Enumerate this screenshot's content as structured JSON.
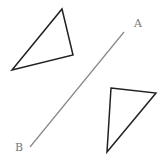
{
  "diagram": {
    "line": {
      "from_label": "A",
      "to_label": "B",
      "x1": 124,
      "y1": 32,
      "x2": 30,
      "y2": 147,
      "color": "#888888"
    },
    "labels": {
      "A": "A",
      "B": "B"
    },
    "triangles": [
      {
        "name": "original",
        "points": "62,9 73,55 12,70",
        "color": "#222222"
      },
      {
        "name": "reflected",
        "points": "111,88 156,93 107,152",
        "color": "#222222"
      }
    ]
  }
}
